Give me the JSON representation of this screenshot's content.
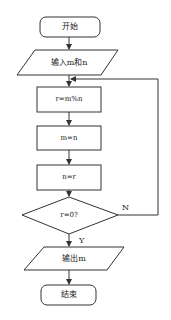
{
  "flowchart": {
    "nodes": [
      {
        "id": "start",
        "shape": "terminal",
        "label": "开始"
      },
      {
        "id": "input",
        "shape": "io",
        "label": "输入m和n"
      },
      {
        "id": "step1",
        "shape": "process",
        "label": "r=m%n"
      },
      {
        "id": "step2",
        "shape": "process",
        "label": "m=n"
      },
      {
        "id": "step3",
        "shape": "process",
        "label": "n=r"
      },
      {
        "id": "cond",
        "shape": "decision",
        "label": "r=0?"
      },
      {
        "id": "output",
        "shape": "io",
        "label": "输出m"
      },
      {
        "id": "end",
        "shape": "terminal",
        "label": "结束"
      }
    ],
    "edges": [
      {
        "from": "start",
        "to": "input",
        "label": ""
      },
      {
        "from": "input",
        "to": "step1",
        "label": ""
      },
      {
        "from": "step1",
        "to": "step2",
        "label": ""
      },
      {
        "from": "step2",
        "to": "step3",
        "label": ""
      },
      {
        "from": "step3",
        "to": "cond",
        "label": ""
      },
      {
        "from": "cond",
        "to": "output",
        "label": "Y"
      },
      {
        "from": "cond",
        "to": "step1",
        "label": "N"
      },
      {
        "from": "output",
        "to": "end",
        "label": ""
      }
    ],
    "branch_labels": {
      "yes": "Y",
      "no": "N"
    }
  }
}
